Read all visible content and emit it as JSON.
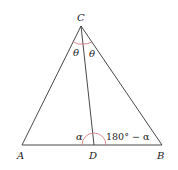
{
  "diagram": {
    "type": "geometry-triangle",
    "points": {
      "C": {
        "label": "C",
        "x": 81,
        "y": 26
      },
      "A": {
        "label": "A",
        "x": 22,
        "y": 145
      },
      "B": {
        "label": "B",
        "x": 162,
        "y": 145
      },
      "D": {
        "label": "D",
        "x": 94,
        "y": 146
      }
    },
    "segments": [
      "CA",
      "CB",
      "AB",
      "CD"
    ],
    "angles": {
      "ACD": "θ",
      "DCB": "θ",
      "ADC": "α",
      "CDB": "180° − α"
    },
    "colors": {
      "line": "#333333",
      "arc": "#d9707a"
    }
  }
}
